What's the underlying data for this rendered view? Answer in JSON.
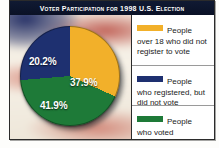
{
  "figure": {
    "title": "Voter Participation for 1998 U.S. Election",
    "background": "blurred-us-flag"
  },
  "colors": {
    "yellow": "#F2B02A",
    "navy": "#1E3070",
    "green": "#1E7A38",
    "title_bar": "#0A1126",
    "legend_bg": "#FFFFFF",
    "frame": "#2B2B2B"
  },
  "labels": {
    "yellow": "37.9%",
    "navy": "20.2%",
    "green": "41.9%"
  },
  "legend": {
    "items": [
      {
        "swatch": "yellow",
        "first_line": "People",
        "rest": "over 18 who did not register to vote",
        "full": "People over 18 who did not register to vote"
      },
      {
        "swatch": "navy",
        "first_line": "People",
        "rest": "who registered, but did not vote",
        "full": "People who registered, but did not vote"
      },
      {
        "swatch": "green",
        "first_line": "People",
        "rest": "who voted",
        "full": "People who voted"
      }
    ]
  },
  "chart_data": {
    "type": "pie",
    "title": "Voter Participation for 1998 U.S. Election",
    "categories": [
      "People over 18 who did not register to vote",
      "People who voted",
      "People who registered, but did not vote"
    ],
    "values": [
      37.9,
      41.9,
      20.2
    ],
    "value_labels": [
      "37.9%",
      "41.9%",
      "20.2%"
    ],
    "colors": [
      "#F2B02A",
      "#1E7A38",
      "#1E3070"
    ],
    "units": "percent",
    "total": 100.0,
    "start_angle_deg": -22,
    "direction": "clockwise",
    "legend_position": "right",
    "grid": false
  }
}
